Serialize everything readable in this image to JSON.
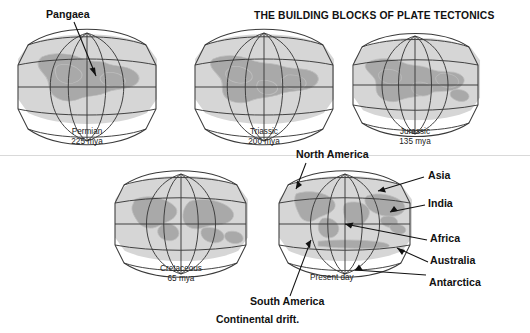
{
  "figure": {
    "title": "THE BUILDING BLOCKS OF PLATE TECTONICS",
    "caption": "Continental drift.",
    "background_color": "#ffffff",
    "ocean_color": "#d6d6d6",
    "land_color": "#a9a9a9",
    "line_color": "#3a3a3a"
  },
  "globes": [
    {
      "id": "permian",
      "era": "Permian",
      "age": "225 mya",
      "row": 1,
      "col": 1
    },
    {
      "id": "triassic",
      "era": "Triassic",
      "age": "200 mya",
      "row": 1,
      "col": 2
    },
    {
      "id": "jurassic",
      "era": "Jurassic",
      "age": "135 mya",
      "row": 1,
      "col": 3
    },
    {
      "id": "cretaceous",
      "era": "Cretaceous",
      "age": "65 mya",
      "row": 2,
      "col": 1
    },
    {
      "id": "present",
      "era": "Present day",
      "age": "",
      "row": 2,
      "col": 2
    }
  ],
  "annotations": {
    "pangaea": "Pangaea",
    "north_america": "North America",
    "south_america": "South America",
    "asia": "Asia",
    "india": "India",
    "africa": "Africa",
    "australia": "Australia",
    "antarctica": "Antarctica",
    "present_day": "Present day"
  }
}
